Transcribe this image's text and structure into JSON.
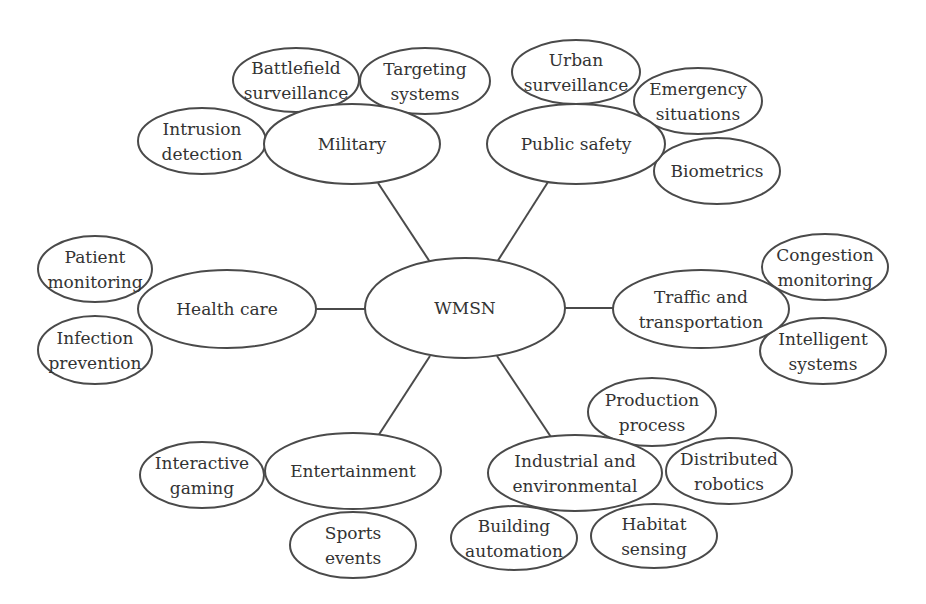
{
  "diagram": {
    "type": "mind-map",
    "stroke_color": "#4a4a4a",
    "text_color": "#333333",
    "background": "#ffffff",
    "center": {
      "id": "wmsn",
      "label": [
        "WMSN"
      ],
      "cx": 465,
      "cy": 308,
      "rx": 100,
      "ry": 50
    },
    "categories": [
      {
        "id": "military",
        "label": [
          "Military"
        ],
        "cx": 352,
        "cy": 144,
        "rx": 88,
        "ry": 40,
        "link": [
          430,
          262,
          378,
          183
        ],
        "children": [
          {
            "id": "battlefield-surveillance",
            "label": [
              "Battlefield",
              "surveillance"
            ],
            "cx": 296,
            "cy": 80,
            "rx": 63,
            "ry": 32
          },
          {
            "id": "targeting-systems",
            "label": [
              "Targeting",
              "systems"
            ],
            "cx": 425,
            "cy": 81,
            "rx": 65,
            "ry": 33
          },
          {
            "id": "intrusion-detection",
            "label": [
              "Intrusion",
              "detection"
            ],
            "cx": 202,
            "cy": 141,
            "rx": 64,
            "ry": 33
          }
        ]
      },
      {
        "id": "public-safety",
        "label": [
          "Public safety"
        ],
        "cx": 576,
        "cy": 144,
        "rx": 89,
        "ry": 40,
        "link": [
          497,
          262,
          548,
          182
        ],
        "children": [
          {
            "id": "urban-surveillance",
            "label": [
              "Urban",
              "surveillance"
            ],
            "cx": 576,
            "cy": 72,
            "rx": 64,
            "ry": 32
          },
          {
            "id": "emergency-situations",
            "label": [
              "Emergency",
              "situations"
            ],
            "cx": 698,
            "cy": 101,
            "rx": 64,
            "ry": 33
          },
          {
            "id": "biometrics",
            "label": [
              "Biometrics"
            ],
            "cx": 717,
            "cy": 171,
            "rx": 63,
            "ry": 33
          }
        ]
      },
      {
        "id": "health-care",
        "label": [
          "Health care"
        ],
        "cx": 227,
        "cy": 309,
        "rx": 89,
        "ry": 39,
        "link": [
          365,
          309,
          316,
          309
        ],
        "children": [
          {
            "id": "patient-monitoring",
            "label": [
              "Patient",
              "monitoring"
            ],
            "cx": 95,
            "cy": 269,
            "rx": 57,
            "ry": 33
          },
          {
            "id": "infection-prevention",
            "label": [
              "Infection",
              "prevention"
            ],
            "cx": 95,
            "cy": 350,
            "rx": 57,
            "ry": 34
          }
        ]
      },
      {
        "id": "traffic-and-transportation",
        "label": [
          "Traffic and",
          "transportation"
        ],
        "cx": 701,
        "cy": 309,
        "rx": 88,
        "ry": 39,
        "link": [
          565,
          308,
          613,
          308
        ],
        "children": [
          {
            "id": "congestion-monitoring",
            "label": [
              "Congestion",
              "monitoring"
            ],
            "cx": 825,
            "cy": 267,
            "rx": 63,
            "ry": 33
          },
          {
            "id": "intelligent-systems",
            "label": [
              "Intelligent",
              "systems"
            ],
            "cx": 823,
            "cy": 351,
            "rx": 63,
            "ry": 33
          }
        ]
      },
      {
        "id": "entertainment",
        "label": [
          "Entertainment"
        ],
        "cx": 353,
        "cy": 471,
        "rx": 88,
        "ry": 38,
        "link": [
          430,
          356,
          378,
          436
        ],
        "children": [
          {
            "id": "interactive-gaming",
            "label": [
              "Interactive",
              "gaming"
            ],
            "cx": 202,
            "cy": 475,
            "rx": 62,
            "ry": 33
          },
          {
            "id": "sports-events",
            "label": [
              "Sports",
              "events"
            ],
            "cx": 353,
            "cy": 545,
            "rx": 63,
            "ry": 33
          }
        ]
      },
      {
        "id": "industrial-and-environmental",
        "label": [
          "Industrial and",
          "environmental"
        ],
        "cx": 575,
        "cy": 473,
        "rx": 87,
        "ry": 38,
        "link": [
          497,
          356,
          551,
          437
        ],
        "children": [
          {
            "id": "production-process",
            "label": [
              "Production",
              "process"
            ],
            "cx": 652,
            "cy": 412,
            "rx": 64,
            "ry": 34
          },
          {
            "id": "distributed-robotics",
            "label": [
              "Distributed",
              "robotics"
            ],
            "cx": 729,
            "cy": 471,
            "rx": 63,
            "ry": 33
          },
          {
            "id": "building-automation",
            "label": [
              "Building",
              "automation"
            ],
            "cx": 514,
            "cy": 538,
            "rx": 63,
            "ry": 32
          },
          {
            "id": "habitat-sensing",
            "label": [
              "Habitat",
              "sensing"
            ],
            "cx": 654,
            "cy": 536,
            "rx": 63,
            "ry": 32
          }
        ]
      }
    ]
  }
}
